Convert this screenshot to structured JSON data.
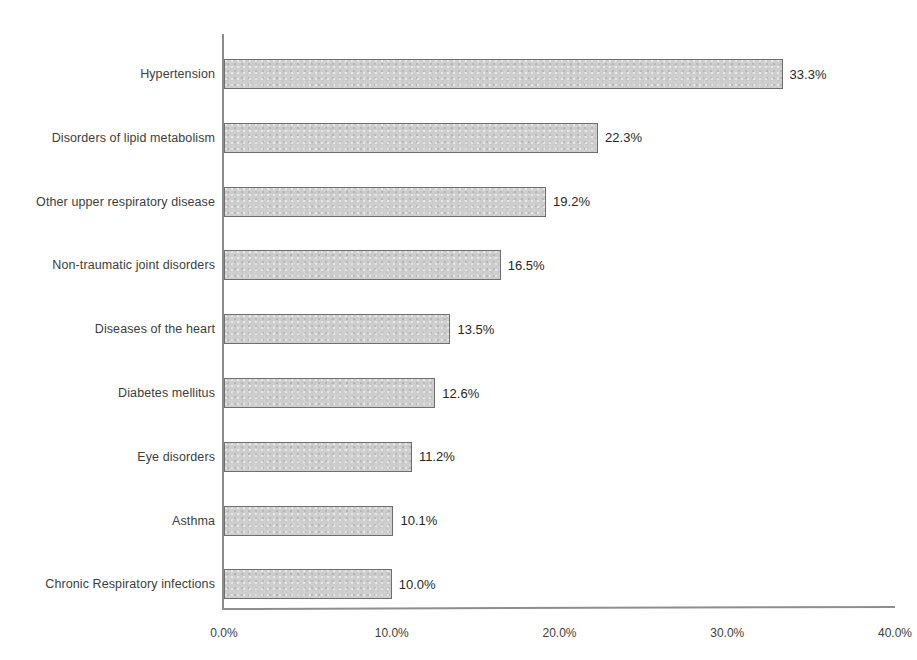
{
  "chart_data": {
    "type": "bar",
    "orientation": "horizontal",
    "title": "",
    "subtitle": "",
    "xlabel": "",
    "ylabel": "",
    "xlim": [
      0,
      40
    ],
    "grid": false,
    "legend": null,
    "categories": [
      "Hypertension",
      "Disorders of lipid metabolism",
      "Other upper respiratory disease",
      "Non-traumatic joint disorders",
      "Diseases of the heart",
      "Diabetes mellitus",
      "Eye disorders",
      "Asthma",
      "Chronic Respiratory infections"
    ],
    "values": [
      33.3,
      22.3,
      19.2,
      16.5,
      13.5,
      12.6,
      11.2,
      10.1,
      10.0
    ],
    "value_labels": [
      "33.3%",
      "22.3%",
      "19.2%",
      "16.5%",
      "13.5%",
      "12.6%",
      "11.2%",
      "10.1%",
      "10.0%"
    ],
    "x_ticks": [
      0,
      10,
      20,
      30,
      40
    ],
    "x_tick_labels": [
      "0.0%",
      "10.0%",
      "20.0%",
      "30.0%",
      "40.0%"
    ],
    "bar_fill_color": "#cdcdcd",
    "bar_border_color": "#6e6e6e",
    "axis_color": "#8c8c8c",
    "text_color": "#3d3d3d",
    "background_color": "#ffffff"
  }
}
